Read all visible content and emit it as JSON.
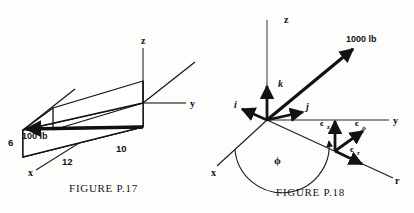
{
  "page": {
    "background_color": "#fdfdfc",
    "ink_color": "#121212",
    "axis_color": "#6e6e6e"
  },
  "figures": [
    {
      "id": "P.17",
      "caption": "FIGURE P.17",
      "description": "Rectangular box with a 100 lb force along the body diagonal",
      "axes": [
        {
          "name": "z",
          "label": "z"
        },
        {
          "name": "y",
          "label": "y"
        },
        {
          "name": "x",
          "label": "x"
        }
      ],
      "dimensions": [
        {
          "name": "height",
          "label": "6"
        },
        {
          "name": "depth",
          "label": "12"
        },
        {
          "name": "length",
          "label": "10"
        }
      ],
      "force": {
        "label": "100 lb",
        "magnitude": 100,
        "unit": "lb"
      }
    },
    {
      "id": "P.18",
      "caption": "FIGURE P.18",
      "description": "Cartesian and cylindrical unit vector triads with a 1000 lb force",
      "axes": [
        {
          "name": "z",
          "label": "z"
        },
        {
          "name": "y",
          "label": "y"
        },
        {
          "name": "x",
          "label": "x"
        },
        {
          "name": "r",
          "label": "r"
        }
      ],
      "cartesian_unit_vectors": [
        {
          "name": "i",
          "label": "i"
        },
        {
          "name": "j",
          "label": "j"
        },
        {
          "name": "k",
          "label": "k"
        }
      ],
      "cylindrical_unit_vectors": [
        {
          "name": "epsilon-z",
          "base": "ϵ",
          "subscript": "z"
        },
        {
          "name": "epsilon-phi",
          "base": "ϵ",
          "subscript": "ϕ"
        },
        {
          "name": "epsilon-r",
          "base": "ϵ",
          "subscript": "r"
        }
      ],
      "angle": {
        "name": "phi",
        "label": "ϕ"
      },
      "force": {
        "label": "1000 lb",
        "magnitude": 1000,
        "unit": "lb"
      }
    }
  ]
}
